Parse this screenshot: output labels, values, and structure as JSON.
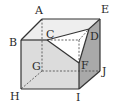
{
  "diagram": {
    "type": "cube-cross-section",
    "colors": {
      "front_face": "#dcdcdc",
      "top_face": "#eeeeee",
      "right_face": "#a9a9a9",
      "triangle": "#ffffff",
      "edge": "#333333",
      "hidden_edge": "#555555"
    },
    "vertices": {
      "A": {
        "label": "A",
        "x": 42,
        "y": 19,
        "lx": 35,
        "ly": 14
      },
      "B": {
        "label": "B",
        "x": 21,
        "y": 40,
        "lx": 9,
        "ly": 46
      },
      "C": {
        "label": "C",
        "x": 47,
        "y": 40,
        "lx": 46,
        "ly": 38
      },
      "D": {
        "label": "D",
        "x": 89,
        "y": 29,
        "lx": 90,
        "ly": 40
      },
      "E": {
        "label": "E",
        "x": 100,
        "y": 19,
        "lx": 101,
        "ly": 13
      },
      "F": {
        "label": "F",
        "x": 79,
        "y": 63,
        "lx": 81,
        "ly": 69
      },
      "G": {
        "label": "G",
        "x": 42,
        "y": 71,
        "lx": 32,
        "ly": 70
      },
      "H": {
        "label": "H",
        "x": 21,
        "y": 89,
        "lx": 10,
        "ly": 100
      },
      "I": {
        "label": "I",
        "x": 79,
        "y": 89,
        "lx": 76,
        "ly": 101
      },
      "J": {
        "label": "J",
        "x": 100,
        "y": 71,
        "lx": 102,
        "ly": 75
      }
    }
  }
}
